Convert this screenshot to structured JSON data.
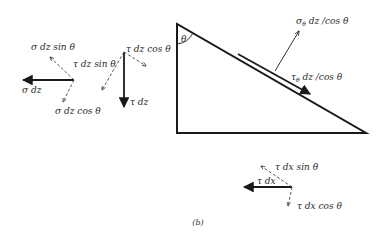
{
  "figure": {
    "caption": "(b)",
    "colors": {
      "ink": "#1a1a1a",
      "background": "#ffffff"
    },
    "triangle": {
      "angle_label": "θ",
      "vertices": {
        "top_left": [
          177,
          24
        ],
        "bottom_left": [
          177,
          133
        ],
        "bottom_right": [
          366,
          133
        ]
      }
    },
    "surface_forces": {
      "normal": {
        "label": "σθ dz /cos θ",
        "sym": "σ",
        "sub": "θ",
        "rest": " dz /cos θ"
      },
      "shear": {
        "label": "τθ dz /cos θ",
        "sym": "τ",
        "sub": "θ",
        "rest": " dz /cos θ"
      }
    },
    "left_group": {
      "resultant": "σ dz",
      "component_up": "σ dz sin θ",
      "component_down": "σ dz cos θ"
    },
    "middle_group": {
      "resultant": "τ dz",
      "component_left": "τ dz sin θ",
      "component_right": "τ dz cos θ"
    },
    "bottom_group": {
      "resultant": "τ dx",
      "component_up": "τ dx sin θ",
      "component_down": "τ dx cos θ"
    }
  }
}
